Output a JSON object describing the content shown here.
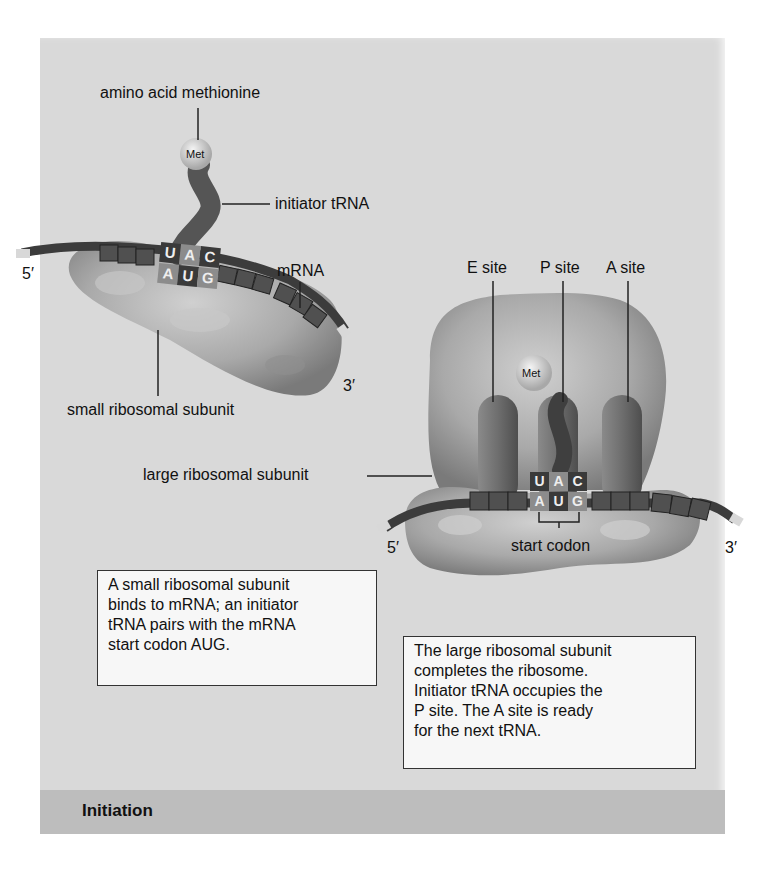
{
  "figure": {
    "stage_title": "Initiation",
    "colors": {
      "panel_bg": "#d9d9d9",
      "footer_bg": "#bdbdbd",
      "ribosome": "#a8a8a8",
      "mrna": "#4a4a4a",
      "trna": "#5a5a5a",
      "codon_dark": "#3a3a3a",
      "codon_light": "#8c8c8c"
    },
    "left_panel": {
      "labels": {
        "amino_acid": "amino acid methionine",
        "met": "Met",
        "initiator_trna": "initiator tRNA",
        "mrna": "mRNA",
        "five_prime": "5′",
        "three_prime": "3′",
        "small_subunit": "small ribosomal subunit"
      },
      "anticodon": [
        "U",
        "A",
        "C"
      ],
      "codon": [
        "A",
        "U",
        "G"
      ],
      "caption": [
        "A small ribosomal subunit",
        "binds to mRNA; an initiator",
        "tRNA pairs with the mRNA",
        "start codon AUG."
      ]
    },
    "right_panel": {
      "labels": {
        "e_site": "E site",
        "p_site": "P site",
        "a_site": "A site",
        "met": "Met",
        "large_subunit": "large ribosomal subunit",
        "start_codon": "start codon",
        "five_prime": "5′",
        "three_prime": "3′"
      },
      "anticodon": [
        "U",
        "A",
        "C"
      ],
      "codon": [
        "A",
        "U",
        "G"
      ],
      "caption": [
        "The large ribosomal subunit",
        "completes the ribosome.",
        "Initiator tRNA occupies the",
        "P site. The A site is ready",
        "for the next tRNA."
      ]
    }
  }
}
